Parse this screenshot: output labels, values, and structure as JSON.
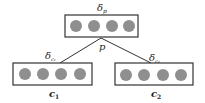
{
  "diagram": {
    "type": "binary-tree-composition",
    "parent": {
      "id": "p",
      "label": "p",
      "delta_label": "δ",
      "delta_sub": "p",
      "units": 4,
      "box": {
        "x": 65,
        "y": 15,
        "w": 73,
        "h": 22
      }
    },
    "children": [
      {
        "id": "c1",
        "label": "c",
        "label_sub": "1",
        "delta_label": "δ",
        "delta_sub": "c₁",
        "units": 4,
        "box": {
          "x": 13,
          "y": 63,
          "w": 79,
          "h": 22
        }
      },
      {
        "id": "c2",
        "label": "c",
        "label_sub": "2",
        "delta_label": "δ",
        "delta_sub": "c₂",
        "units": 4,
        "box": {
          "x": 115,
          "y": 63,
          "w": 78,
          "h": 22
        }
      }
    ],
    "colors": {
      "node_fill": "#8f8f8f",
      "box_stroke": "#333333",
      "edge": "#333333"
    }
  }
}
